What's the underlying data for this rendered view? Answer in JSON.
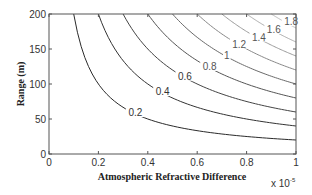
{
  "chart_data": {
    "type": "contour",
    "title": "",
    "xlabel": "Atmospheric Refractive Difference",
    "ylabel": "Range (m)",
    "x_exponent_label": "x 10",
    "x_exponent": "-5",
    "xlim": [
      0,
      1
    ],
    "ylim": [
      0,
      200
    ],
    "xticks": [
      0,
      0.2,
      0.4,
      0.6,
      0.8,
      1
    ],
    "xtick_labels": [
      "0",
      "0.2",
      "0.4",
      "0.6",
      "0.8",
      "1"
    ],
    "yticks": [
      0,
      50,
      100,
      150,
      200
    ],
    "ytick_labels": [
      "0",
      "50",
      "100",
      "150",
      "200"
    ],
    "grid": false,
    "legend": null,
    "function": "z = x * y / 100 (x in units of 1e-5)",
    "levels": [
      0.2,
      0.4,
      0.6,
      0.8,
      1.0,
      1.2,
      1.4,
      1.6,
      1.8
    ],
    "level_labels": [
      "0.2",
      "0.4",
      "0.6",
      "0.8",
      "1",
      "1.2",
      "1.4",
      "1.6",
      "1.8"
    ],
    "label_positions": [
      {
        "level": "0.2",
        "x": 0.35,
        "y": 57
      },
      {
        "level": "0.4",
        "x": 0.46,
        "y": 87
      },
      {
        "level": "0.6",
        "x": 0.55,
        "y": 109
      },
      {
        "level": "0.8",
        "x": 0.65,
        "y": 123
      },
      {
        "level": "1",
        "x": 0.72,
        "y": 139
      },
      {
        "level": "1.2",
        "x": 0.77,
        "y": 155
      },
      {
        "level": "1.4",
        "x": 0.85,
        "y": 165
      },
      {
        "level": "1.6",
        "x": 0.91,
        "y": 176
      },
      {
        "level": "1.8",
        "x": 0.98,
        "y": 187
      }
    ],
    "level_colors": [
      "#2a2a2a",
      "#333333",
      "#444444",
      "#555555",
      "#6a6a6a",
      "#888888",
      "#9a9a9a",
      "#aaaaaa",
      "#b8b8b8"
    ]
  }
}
